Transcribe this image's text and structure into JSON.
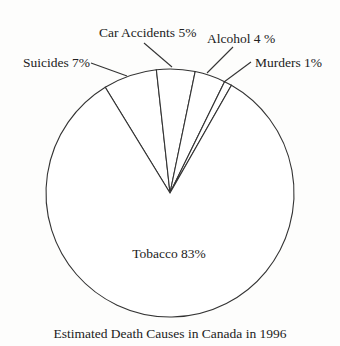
{
  "chart_data": {
    "type": "pie",
    "title": "Estimated Death Causes in Canada in 1996",
    "start_angle_deg": -31.5,
    "direction": "clockwise",
    "slices": [
      {
        "label": "Suicides",
        "value": 7,
        "display": "Suicides 7%"
      },
      {
        "label": "Car Accidents",
        "value": 5,
        "display": "Car Accidents 5%"
      },
      {
        "label": "Alcohol",
        "value": 4,
        "display": "Alcohol 4 %"
      },
      {
        "label": "Murders",
        "value": 1,
        "display": "Murders 1%"
      },
      {
        "label": "Tobacco",
        "value": 83,
        "display": "Tobacco 83%"
      }
    ],
    "units": "%",
    "legend": "none (labels on/near slices)"
  },
  "layout": {
    "center": [
      170,
      193
    ],
    "radius": 124,
    "labels": [
      {
        "x": 23,
        "y": 67,
        "anchor": "start",
        "leader": [
          [
            91,
            63
          ],
          [
            127,
            76
          ]
        ]
      },
      {
        "x": 99,
        "y": 37,
        "anchor": "start",
        "leader": [
          [
            144,
            43
          ],
          [
            172,
            67
          ]
        ]
      },
      {
        "x": 207,
        "y": 43,
        "anchor": "start",
        "leader": [
          [
            233,
            47
          ],
          [
            207,
            73
          ]
        ]
      },
      {
        "x": 255,
        "y": 67,
        "anchor": "start",
        "leader": [
          [
            251,
            62
          ],
          [
            224,
            82
          ]
        ]
      },
      {
        "x": 169,
        "y": 258,
        "anchor": "middle",
        "leader": null
      }
    ],
    "title_pos": [
      170,
      338
    ]
  }
}
